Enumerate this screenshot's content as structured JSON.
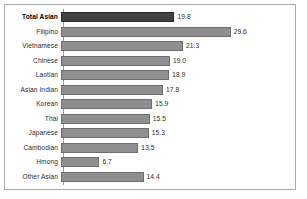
{
  "chart_data": {
    "type": "bar",
    "orientation": "horizontal",
    "title": "",
    "xlabel": "",
    "ylabel": "",
    "xlim": [
      0,
      33.5
    ],
    "grid": false,
    "legend": null,
    "categories": [
      "Total Asian",
      "Filipino",
      "Vietnamese",
      "Chinese",
      "Laotian",
      "Asian Indian",
      "Korean",
      "Thai",
      "Japanese",
      "Cambodian",
      "Hmong",
      "Other Asian"
    ],
    "values": [
      19.8,
      29.6,
      21.3,
      19.0,
      18.9,
      17.8,
      15.9,
      15.5,
      15.3,
      13.5,
      6.7,
      14.4
    ],
    "value_labels": [
      "19.8",
      "29.6",
      "21.3",
      "19.0",
      "18.9",
      "17.8",
      "15.9",
      "15.5",
      "15.3",
      "13.5",
      "6.7",
      "14.4"
    ],
    "highlight_index": 0
  },
  "style": {
    "bar_color": "#8f8f8f",
    "bar_border_color": "#6e6e6e",
    "highlight_bar_color": "#404040",
    "highlight_bar_border_color": "#2a2a2a",
    "frame_border_color": "#a8a8a8",
    "axis_color": "#9a9a9a",
    "text_color": "#2b2b2b",
    "background": "#ffffff"
  }
}
